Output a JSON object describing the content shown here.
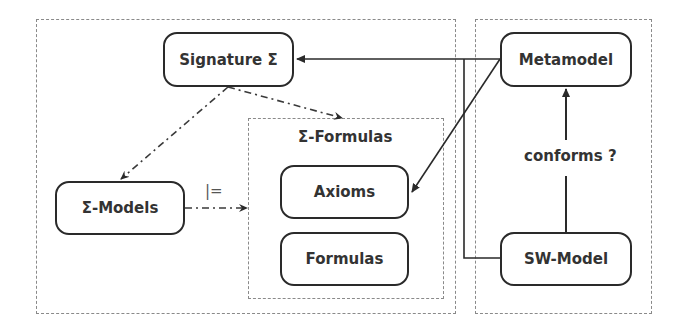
{
  "diagram": {
    "frames": {
      "logic_frame": {
        "label": ""
      },
      "modeling_frame": {
        "label": ""
      },
      "formulas_group": {
        "label": "Σ-Formulas"
      }
    },
    "nodes": {
      "signature": {
        "label": "Signature Σ"
      },
      "metamodel": {
        "label": "Metamodel"
      },
      "models": {
        "label": "Σ-Models"
      },
      "axioms": {
        "label": "Axioms"
      },
      "formulas": {
        "label": "Formulas"
      },
      "sw_model": {
        "label": "SW-Model"
      }
    },
    "edges": [
      {
        "from": "Metamodel",
        "to": "Signature Σ",
        "style": "solid",
        "arrow": "end"
      },
      {
        "from": "Metamodel",
        "to": "Axioms",
        "style": "solid",
        "arrow": "end"
      },
      {
        "from": "SW-Model",
        "to": "Signature Σ (line)",
        "style": "solid",
        "arrow": "none"
      },
      {
        "from": "SW-Model",
        "to": "Metamodel",
        "style": "solid",
        "arrow": "end",
        "label": "conforms ?"
      },
      {
        "from": "Signature Σ",
        "to": "Σ-Models",
        "style": "dash-dot",
        "arrow": "end"
      },
      {
        "from": "Signature Σ",
        "to": "Σ-Formulas",
        "style": "dash-dot",
        "arrow": "end"
      },
      {
        "from": "Σ-Models",
        "to": "Σ-Formulas",
        "style": "dash-dot",
        "arrow": "end",
        "label": "|="
      }
    ],
    "edge_labels": {
      "conforms": "conforms ?",
      "satisfies": "|="
    },
    "colors": {
      "stroke": "#2a2a2a",
      "frame": "#8a8a8a",
      "text": "#333333"
    }
  }
}
